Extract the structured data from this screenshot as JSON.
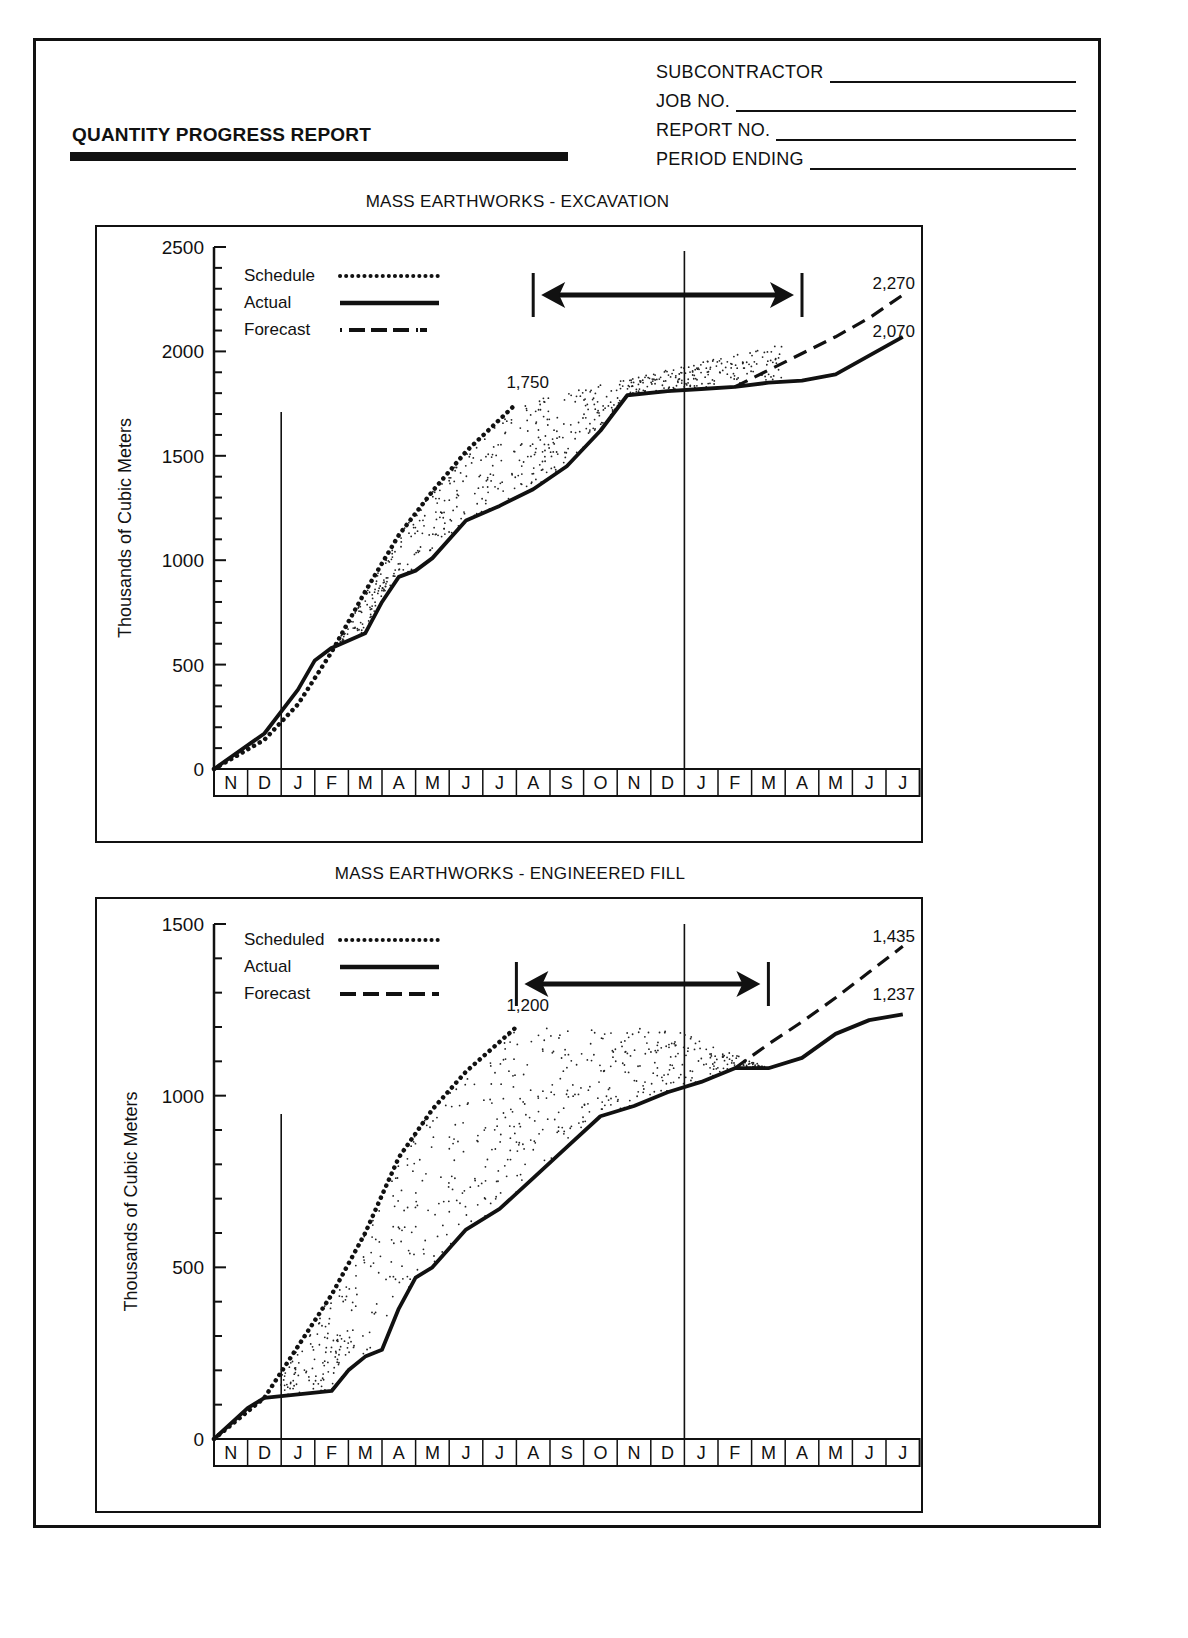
{
  "header": {
    "title": "QUANTITY PROGRESS REPORT",
    "fields": [
      {
        "label": "SUBCONTRACTOR",
        "value": ""
      },
      {
        "label": "JOB NO.",
        "value": ""
      },
      {
        "label": "REPORT NO.",
        "value": ""
      },
      {
        "label": "PERIOD ENDING",
        "value": ""
      }
    ]
  },
  "charts": [
    {
      "title": "MASS EARTHWORKS - EXCAVATION",
      "ylabel": "Thousands of Cubic Meters",
      "yticks": [
        "2500",
        "2000",
        "1500",
        "1000",
        "500",
        "0"
      ],
      "legend": [
        {
          "label": "Schedule",
          "style": "dotted"
        },
        {
          "label": "Actual",
          "style": "solid"
        },
        {
          "label": "Forecast",
          "style": "dash-dot"
        }
      ],
      "annotations": {
        "schedule_end": "1,750",
        "forecast_end": "2,270",
        "actual_end": "2,070"
      }
    },
    {
      "title": "MASS EARTHWORKS - ENGINEERED FILL",
      "ylabel": "Thousands of Cubic Meters",
      "yticks": [
        "1500",
        "1000",
        "500",
        "0"
      ],
      "legend": [
        {
          "label": "Scheduled",
          "style": "dotted"
        },
        {
          "label": "Actual",
          "style": "solid"
        },
        {
          "label": "Forecast",
          "style": "dashed"
        }
      ],
      "annotations": {
        "schedule_end": "1,200",
        "forecast_end": "1,435",
        "actual_end": "1,237"
      }
    }
  ],
  "months": [
    "N",
    "D",
    "J",
    "F",
    "M",
    "A",
    "M",
    "J",
    "J",
    "A",
    "S",
    "O",
    "N",
    "D",
    "J",
    "F",
    "M",
    "A",
    "M",
    "J",
    "J"
  ],
  "chart_data": [
    {
      "type": "line",
      "title": "MASS EARTHWORKS - EXCAVATION",
      "xlabel": "",
      "ylabel": "Thousands of Cubic Meters",
      "ylim": [
        0,
        2500
      ],
      "categories": [
        "N",
        "D",
        "J",
        "F",
        "M",
        "A",
        "M",
        "J",
        "J",
        "A",
        "S",
        "O",
        "N",
        "D",
        "J",
        "F",
        "M",
        "A",
        "M",
        "J",
        "J"
      ],
      "series": [
        {
          "name": "Schedule",
          "style": "dotted",
          "x": [
            0,
            1,
            2,
            3,
            4,
            5,
            6,
            7,
            8.5
          ],
          "values": [
            0,
            140,
            310,
            560,
            850,
            1120,
            1330,
            1520,
            1750
          ]
        },
        {
          "name": "Actual",
          "style": "solid",
          "x": [
            0,
            1,
            2,
            2.5,
            3,
            4,
            4.5,
            5,
            5.5,
            6,
            7,
            8,
            9,
            10,
            11,
            11.8,
            13,
            14,
            15,
            16,
            17,
            18,
            19,
            20
          ],
          "values": [
            0,
            170,
            380,
            520,
            580,
            650,
            800,
            920,
            950,
            1010,
            1190,
            1260,
            1340,
            1450,
            1620,
            1790,
            1810,
            1820,
            1830,
            1850,
            1860,
            1890,
            1980,
            2070
          ]
        },
        {
          "name": "Forecast",
          "style": "dash-dot",
          "x": [
            15,
            16,
            17,
            18,
            19,
            20
          ],
          "values": [
            1830,
            1910,
            1990,
            2070,
            2160,
            2270
          ]
        }
      ],
      "annotations": [
        {
          "text": "1,750",
          "x": 8.5,
          "y": 1750
        },
        {
          "text": "2,270",
          "x": 20,
          "y": 2270
        },
        {
          "text": "2,070",
          "x": 20,
          "y": 2070
        }
      ],
      "variance_arrow": {
        "from_month_index": 9.5,
        "to_month_index": 17.5
      },
      "reference_lines_month_index": [
        2,
        14
      ],
      "grid": false,
      "legend_position": "top-left"
    },
    {
      "type": "line",
      "title": "MASS EARTHWORKS - ENGINEERED FILL",
      "xlabel": "",
      "ylabel": "Thousands of Cubic Meters",
      "ylim": [
        0,
        1500
      ],
      "categories": [
        "N",
        "D",
        "J",
        "F",
        "M",
        "A",
        "M",
        "J",
        "J",
        "A",
        "S",
        "O",
        "N",
        "D",
        "J",
        "F",
        "M",
        "A",
        "M",
        "J",
        "J"
      ],
      "series": [
        {
          "name": "Scheduled",
          "style": "dotted",
          "x": [
            0,
            1,
            2,
            3,
            4,
            5,
            6,
            7,
            8.5
          ],
          "values": [
            0,
            120,
            270,
            420,
            600,
            820,
            960,
            1070,
            1200
          ]
        },
        {
          "name": "Actual",
          "style": "solid",
          "x": [
            0,
            0.5,
            1,
            2,
            3,
            3.5,
            4,
            4.5,
            5,
            5.5,
            6,
            7,
            8,
            9,
            10,
            11,
            12,
            13,
            14,
            15,
            16,
            17,
            18,
            19,
            20
          ],
          "values": [
            0,
            90,
            120,
            130,
            140,
            200,
            240,
            260,
            380,
            470,
            500,
            610,
            670,
            760,
            850,
            940,
            970,
            1010,
            1040,
            1080,
            1080,
            1110,
            1180,
            1220,
            1237
          ]
        },
        {
          "name": "Forecast",
          "style": "dashed",
          "x": [
            15,
            16,
            17,
            18,
            19,
            20
          ],
          "values": [
            1080,
            1150,
            1215,
            1285,
            1360,
            1435
          ]
        }
      ],
      "annotations": [
        {
          "text": "1,200",
          "x": 8.5,
          "y": 1200
        },
        {
          "text": "1,435",
          "x": 20,
          "y": 1435
        },
        {
          "text": "1,237",
          "x": 20,
          "y": 1237
        }
      ],
      "variance_arrow": {
        "from_month_index": 9,
        "to_month_index": 16.5
      },
      "reference_lines_month_index": [
        2,
        14
      ],
      "grid": false,
      "legend_position": "top-left"
    }
  ]
}
